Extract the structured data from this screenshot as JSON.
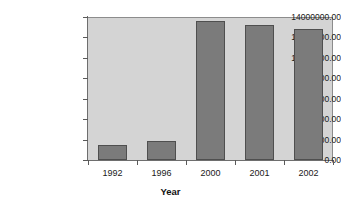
{
  "chart_data": {
    "type": "bar",
    "title": "",
    "subtitle": "",
    "xlabel": "Year",
    "ylabel": "",
    "categories": [
      "1992",
      "1996",
      "2000",
      "2001",
      "2002"
    ],
    "values": [
      1450000,
      1900000,
      13600000,
      13200000,
      12800000
    ],
    "series": [
      {
        "name": "",
        "values": [
          1450000,
          1900000,
          13600000,
          13200000,
          12800000
        ]
      }
    ],
    "ylim": [
      0,
      14000000
    ],
    "ytick_values": [
      0,
      2000000,
      4000000,
      6000000,
      8000000,
      10000000,
      12000000,
      14000000
    ],
    "ytick_labels": [
      "0.00",
      "2000000.00",
      "4000000.00",
      "6000000.00",
      "8000000.00",
      "10000000.00",
      "12000000.00",
      "14000000.00"
    ],
    "xtick_labels": [
      "1992",
      "1996",
      "2000",
      "2001",
      "2002"
    ],
    "grid": false,
    "legend": null,
    "legend_position": "none",
    "annotations": [],
    "colors": {
      "bar_fill": "#7b7b7b",
      "bar_border": "#4f4f4f",
      "plot_background": "#d4d4d4",
      "figure_background": "#ffffff",
      "axis_line": "#6e6e6e",
      "text": "#1a1a1a"
    }
  }
}
